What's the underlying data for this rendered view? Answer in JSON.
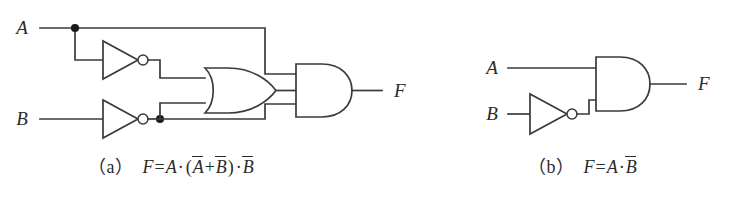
{
  "figure": {
    "line_color": "#3a3a3c",
    "junction_color": "#1b1b1b",
    "background_color": "#ffffff"
  },
  "circuit_a": {
    "id": "a",
    "inputs": [
      {
        "name": "input-a",
        "label": "A"
      },
      {
        "name": "input-b",
        "label": "B"
      }
    ],
    "output": {
      "name": "output-f",
      "label": "F"
    },
    "gates": [
      {
        "name": "not-gate-a",
        "type": "NOT",
        "input": "A",
        "output": "A-bar"
      },
      {
        "name": "not-gate-b",
        "type": "NOT",
        "input": "B",
        "output": "B-bar"
      },
      {
        "name": "or-gate",
        "type": "OR",
        "inputs": [
          "A-bar",
          "B-bar"
        ],
        "output": "A-bar + B-bar"
      },
      {
        "name": "and-gate",
        "type": "AND",
        "inputs": [
          "A",
          "A-bar + B-bar",
          "B-bar"
        ],
        "output": "F"
      }
    ],
    "junctions": [
      {
        "name": "junction-a-fanout",
        "signal": "A"
      },
      {
        "name": "junction-bbar-fanout",
        "signal": "B-bar"
      }
    ],
    "caption": {
      "tag": "（a）",
      "lhs": "F",
      "equals": "=",
      "terms": [
        {
          "text": "A",
          "overbar": false
        },
        {
          "text": "·",
          "operator": true
        },
        {
          "text": "(",
          "operator": true
        },
        {
          "text": "A",
          "overbar": true
        },
        {
          "text": "+",
          "operator": true
        },
        {
          "text": "B",
          "overbar": true
        },
        {
          "text": ")",
          "operator": true
        },
        {
          "text": "·",
          "operator": true
        },
        {
          "text": "B",
          "overbar": true
        }
      ],
      "plain": "（a）F = A·(A̅ + B̅)·B̅"
    }
  },
  "circuit_b": {
    "id": "b",
    "inputs": [
      {
        "name": "input-a",
        "label": "A"
      },
      {
        "name": "input-b",
        "label": "B"
      }
    ],
    "output": {
      "name": "output-f",
      "label": "F"
    },
    "gates": [
      {
        "name": "not-gate-b",
        "type": "NOT",
        "input": "B",
        "output": "B-bar"
      },
      {
        "name": "and-gate",
        "type": "AND",
        "inputs": [
          "A",
          "B-bar"
        ],
        "output": "F"
      }
    ],
    "junctions": [],
    "caption": {
      "tag": "（b）",
      "lhs": "F",
      "equals": "=",
      "terms": [
        {
          "text": "A",
          "overbar": false
        },
        {
          "text": "·",
          "operator": true
        },
        {
          "text": "B",
          "overbar": true
        }
      ],
      "plain": "（b）F = A·B̅"
    }
  }
}
